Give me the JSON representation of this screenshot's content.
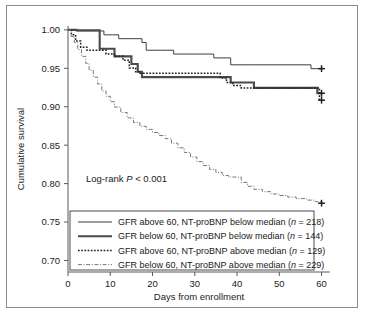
{
  "figure": {
    "annotation": "Log-rank",
    "annotation_stat": "P",
    "annotation_value": "< 0.001"
  },
  "axes": {
    "xlabel": "Days from enrollment",
    "ylabel": "Cumulative survival",
    "xticks": [
      "0",
      "10",
      "20",
      "30",
      "40",
      "50",
      "60"
    ],
    "yticks": [
      "0.70",
      "0.75",
      "0.80",
      "0.85",
      "0.90",
      "0.95",
      "1.00"
    ]
  },
  "legend": {
    "items": [
      {
        "label": "GFR above 60, NT-proBNP below median (",
        "n_sym": "n",
        "n_eq": " = ",
        "n_val": "218",
        "close": ")",
        "style": "thin-solid"
      },
      {
        "label": "GFR below 60, NT-proBNP below median (",
        "n_sym": "n",
        "n_eq": " = ",
        "n_val": "144",
        "close": ")",
        "style": "thick-solid"
      },
      {
        "label": "GFR above 60, NT-proBNP above median (",
        "n_sym": "n",
        "n_eq": " = ",
        "n_val": "129",
        "close": ")",
        "style": "dotted"
      },
      {
        "label": "GFR below 60, NT-proBNP above median (",
        "n_sym": "n",
        "n_eq": " = ",
        "n_val": "229",
        "close": ")",
        "style": "dashdot"
      }
    ]
  },
  "chart_data": {
    "type": "line",
    "title": "",
    "xlabel": "Days from enrollment",
    "ylabel": "Cumulative survival",
    "xlim": [
      0,
      62
    ],
    "ylim": [
      0.685,
      1.005
    ],
    "grid": false,
    "legend_position": "bottom-left",
    "curve_style": "kaplan-meier-step",
    "series": [
      {
        "name": "GFR above 60, NT-proBNP below median (n = 218)",
        "n": 218,
        "style": "thin-solid",
        "color": "#3f3f3f",
        "censor_marks": [
          {
            "x": 60,
            "y": 0.9495
          }
        ],
        "x": [
          0,
          1.0,
          2.0,
          7.5,
          8.5,
          10.5,
          12.0,
          14.5,
          17.5,
          18.5,
          23.5,
          25.0,
          30.0,
          34.5,
          38.5,
          44.0,
          57.5,
          60.0
        ],
        "y": [
          1.0,
          0.9995,
          0.9985,
          0.9985,
          0.9935,
          0.9935,
          0.9885,
          0.9885,
          0.9835,
          0.9735,
          0.9735,
          0.9685,
          0.9685,
          0.9635,
          0.9545,
          0.9545,
          0.9495,
          0.9495
        ]
      },
      {
        "name": "GFR below 60, NT-proBNP below median (n = 144)",
        "n": 144,
        "style": "thick-solid",
        "color": "#4a4a4a",
        "censor_marks": [
          {
            "x": 60,
            "y": 0.9175
          }
        ],
        "x": [
          0,
          2.0,
          7.0,
          7.5,
          10.5,
          11.0,
          14.0,
          15.0,
          16.5,
          17.5,
          37.0,
          38.5,
          40.0,
          44.0,
          57.5,
          59.0,
          60.0
        ],
        "y": [
          1.0,
          0.9995,
          0.9995,
          0.9755,
          0.9755,
          0.9655,
          0.9655,
          0.9555,
          0.9455,
          0.9385,
          0.9385,
          0.9315,
          0.9315,
          0.9245,
          0.9245,
          0.9175,
          0.9175
        ]
      },
      {
        "name": "GFR above 60, NT-proBNP above median (n = 129)",
        "n": 129,
        "style": "dotted",
        "color": "#1f1f1f",
        "censor_marks": [
          {
            "x": 60,
            "y": 0.9085
          }
        ],
        "x": [
          0,
          0.8,
          1.8,
          3.0,
          4.5,
          7.5,
          9.0,
          11.0,
          13.0,
          14.5,
          16.0,
          17.0,
          34.5,
          36.0,
          37.5,
          39.0,
          41.0,
          58.0,
          59.5,
          60.0
        ],
        "y": [
          1.0,
          0.9935,
          0.9855,
          0.9775,
          0.9735,
          0.9735,
          0.9685,
          0.9655,
          0.9605,
          0.9505,
          0.9455,
          0.9435,
          0.9435,
          0.9375,
          0.9315,
          0.9275,
          0.9245,
          0.9245,
          0.9085,
          0.9085
        ]
      },
      {
        "name": "GFR below 60, NT-proBNP above median (n = 229)",
        "n": 229,
        "style": "dashdot",
        "color": "#777777",
        "censor_marks": [
          {
            "x": 60,
            "y": 0.7745
          }
        ],
        "x": [
          0,
          0.7,
          1.5,
          2.3,
          3.2,
          4.2,
          5.0,
          6.0,
          7.0,
          8.0,
          9.0,
          10.0,
          11.0,
          12.5,
          14.0,
          15.5,
          17.0,
          18.5,
          20.0,
          21.5,
          23.0,
          24.5,
          26.0,
          27.5,
          29.0,
          30.5,
          32.0,
          33.5,
          35.0,
          36.5,
          38.0,
          39.5,
          41.0,
          42.5,
          44.0,
          46.0,
          48.0,
          50.0,
          52.0,
          54.0,
          56.5,
          58.5,
          60.0
        ],
        "y": [
          1.0,
          0.9915,
          0.9835,
          0.9745,
          0.9655,
          0.9565,
          0.9475,
          0.9385,
          0.9295,
          0.9205,
          0.9135,
          0.9065,
          0.8995,
          0.8925,
          0.8855,
          0.8795,
          0.8745,
          0.8705,
          0.8665,
          0.8625,
          0.8585,
          0.8525,
          0.8465,
          0.8405,
          0.8345,
          0.8285,
          0.8235,
          0.8185,
          0.8145,
          0.8105,
          0.8085,
          0.8085,
          0.8015,
          0.7965,
          0.7925,
          0.7895,
          0.7865,
          0.7845,
          0.7825,
          0.7805,
          0.7785,
          0.7765,
          0.7745
        ]
      }
    ]
  }
}
